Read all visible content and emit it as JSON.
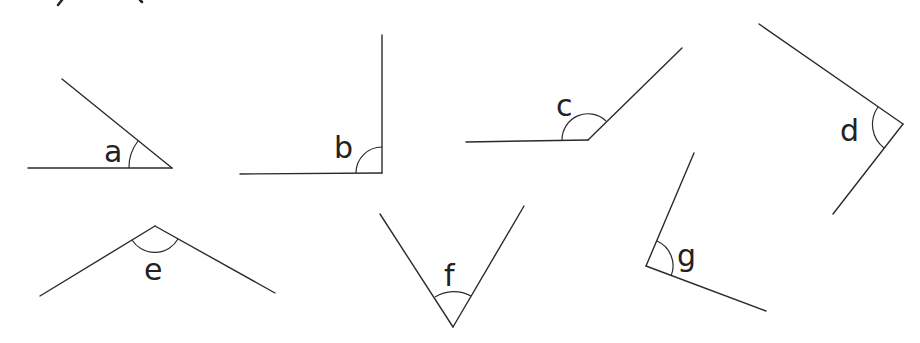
{
  "diagram": {
    "type": "angle-identification-worksheet",
    "stroke_color": "#2b2b2b",
    "background": "#ffffff",
    "angles": [
      {
        "label": "a",
        "vertex": [
          172,
          168
        ],
        "arm1": [
          28,
          168
        ],
        "arm2": [
          62,
          78
        ],
        "kind": "acute"
      },
      {
        "label": "b",
        "vertex": [
          382,
          173
        ],
        "arm1": [
          240,
          173
        ],
        "arm2": [
          382,
          35
        ],
        "kind": "right"
      },
      {
        "label": "c",
        "vertex": [
          588,
          141
        ],
        "arm1": [
          466,
          142
        ],
        "arm2": [
          682,
          48
        ],
        "kind": "obtuse"
      },
      {
        "label": "d",
        "vertex": [
          903,
          124
        ],
        "arm1": [
          759,
          24
        ],
        "arm2": [
          833,
          214
        ],
        "kind": "right"
      },
      {
        "label": "e",
        "vertex": [
          155,
          226
        ],
        "arm1": [
          40,
          296
        ],
        "arm2": [
          275,
          293
        ],
        "kind": "obtuse"
      },
      {
        "label": "f",
        "vertex": [
          453,
          327
        ],
        "arm1": [
          380,
          214
        ],
        "arm2": [
          524,
          206
        ],
        "kind": "acute"
      },
      {
        "label": "g",
        "vertex": [
          646,
          266
        ],
        "arm1": [
          694,
          153
        ],
        "arm2": [
          766,
          311
        ],
        "kind": "right"
      }
    ]
  }
}
